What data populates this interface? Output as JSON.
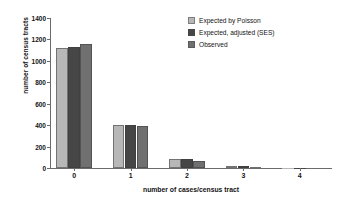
{
  "chart_data": {
    "type": "bar",
    "title": "",
    "xlabel": "number of cases/census tract",
    "ylabel": "number of census tracts",
    "categories": [
      "0",
      "1",
      "2",
      "3",
      "4"
    ],
    "ylim": [
      0,
      1400
    ],
    "yticks": [
      0,
      200,
      400,
      600,
      800,
      1000,
      1200,
      1400
    ],
    "ytick_labels": [
      "0",
      "200",
      "400",
      "600",
      "800",
      "1000",
      "1200",
      "1400"
    ],
    "grid": false,
    "legend_position": "top-right",
    "series": [
      {
        "name": "Expected by Poisson",
        "color": "#b7b7b7",
        "values": [
          1120,
          405,
          85,
          12,
          1
        ]
      },
      {
        "name": "Expected, adjusted (SES)",
        "color": "#464646",
        "values": [
          1125,
          398,
          80,
          14,
          1
        ]
      },
      {
        "name": "Observed",
        "color": "#707070",
        "values": [
          1155,
          393,
          68,
          10,
          0
        ]
      }
    ]
  },
  "legend": {
    "items": [
      {
        "label": "Expected by Poisson"
      },
      {
        "label": "Expected, adjusted (SES)"
      },
      {
        "label": "Observed"
      }
    ]
  }
}
